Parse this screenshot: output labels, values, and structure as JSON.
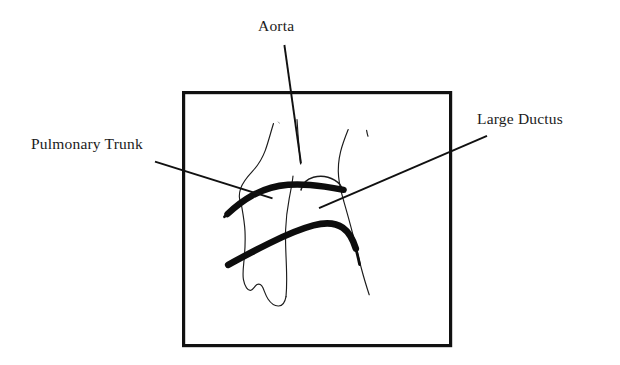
{
  "figure": {
    "kind": "hand-drawn anatomical sketch",
    "background_color": "#ffffff",
    "ink_color": "#111111",
    "frame": {
      "name": "diagram-border",
      "x": 182,
      "y": 91,
      "width": 270,
      "height": 256,
      "stroke_width": 3.2
    },
    "labels": [
      {
        "id": "aorta",
        "text": "Aorta",
        "x": 258,
        "y": 18,
        "leader": {
          "x1": 284,
          "y1": 45,
          "x2": 301,
          "y2": 163
        }
      },
      {
        "id": "pulmonary-trunk",
        "text": "Pulmonary Trunk",
        "x": 31,
        "y": 136,
        "leader": {
          "x1": 155,
          "y1": 162,
          "x2": 272,
          "y2": 198
        }
      },
      {
        "id": "large-ductus",
        "text": "Large Ductus",
        "x": 477,
        "y": 111,
        "leader": {
          "x1": 319,
          "y1": 208,
          "x2": 487,
          "y2": 136
        }
      }
    ],
    "sketch": {
      "thin_stroke_width": 1.15,
      "thick_stroke_width": 6.2,
      "parts": [
        {
          "name": "left-heart-contour",
          "style": "thin"
        },
        {
          "name": "heart-apex-contour",
          "style": "thin"
        },
        {
          "name": "mid-septum-contour",
          "style": "thin"
        },
        {
          "name": "right-chest-contour",
          "style": "thin"
        },
        {
          "name": "right-lower-contour",
          "style": "thin"
        },
        {
          "name": "small-tick-mark",
          "style": "thin"
        },
        {
          "name": "aortic-arch-hook",
          "style": "thin"
        },
        {
          "name": "pulmonary-trunk-stroke",
          "style": "thick"
        },
        {
          "name": "ductus-stroke",
          "style": "thick"
        }
      ]
    }
  }
}
